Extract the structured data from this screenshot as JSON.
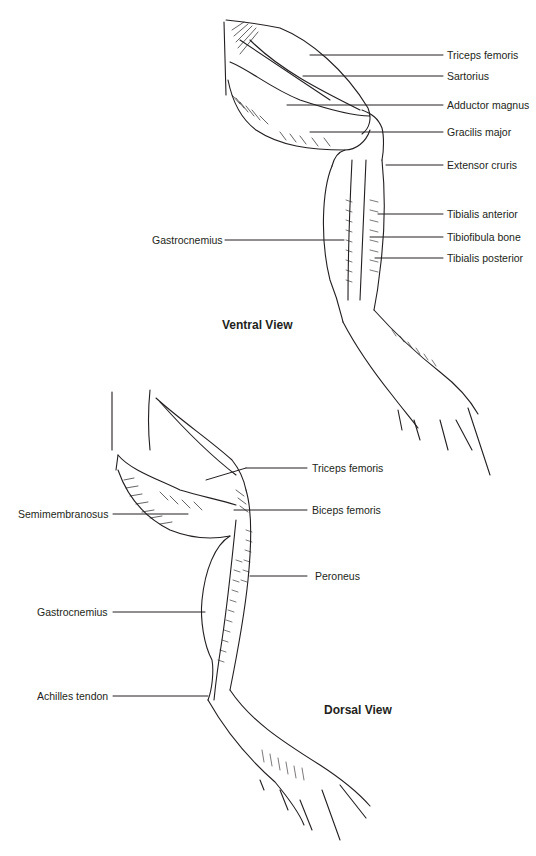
{
  "ventral": {
    "title": "Ventral View",
    "labels": [
      {
        "text": "Triceps femoris"
      },
      {
        "text": "Sartorius"
      },
      {
        "text": "Adductor magnus"
      },
      {
        "text": "Gracilis major"
      },
      {
        "text": "Extensor cruris"
      },
      {
        "text": "Tibialis anterior"
      },
      {
        "text": "Tibiofibula bone"
      },
      {
        "text": "Tibialis posterior"
      },
      {
        "text": "Gastrocnemius"
      }
    ]
  },
  "dorsal": {
    "title": "Dorsal View",
    "labels": [
      {
        "text": "Triceps femoris"
      },
      {
        "text": "Biceps femoris"
      },
      {
        "text": "Peroneus"
      },
      {
        "text": "Semimembranosus"
      },
      {
        "text": "Gastrocnemius"
      },
      {
        "text": "Achilles tendon"
      }
    ]
  },
  "colors": {
    "ink": "#231f20",
    "background": "#ffffff"
  }
}
